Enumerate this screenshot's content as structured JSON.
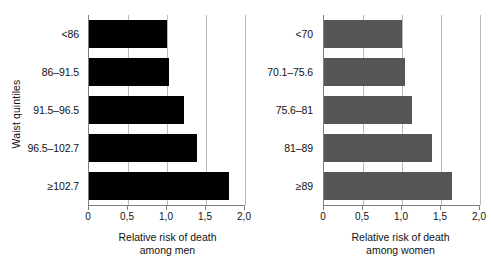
{
  "chart_data": [
    {
      "type": "bar",
      "orientation": "horizontal",
      "panel": "men",
      "title": "",
      "xlabel": "Relative risk of death among men",
      "xlabel_line1": "Relative risk of death",
      "xlabel_line2": "among men",
      "ylabel": "Waist quintiles",
      "categories": [
        "<86",
        "86–91.5",
        "91.5–96.5",
        "96.5–102.7",
        "≥102.7"
      ],
      "values": [
        1.0,
        1.03,
        1.22,
        1.39,
        1.79
      ],
      "bar_color": "#000000",
      "xlim": [
        0,
        2.0
      ],
      "xticks": [
        0,
        0.5,
        1.0,
        1.5,
        2.0
      ],
      "xticklabels": [
        "0",
        "0,5",
        "1,0",
        "1,5",
        "2,0"
      ],
      "grid": true,
      "legend": "none"
    },
    {
      "type": "bar",
      "orientation": "horizontal",
      "panel": "women",
      "title": "",
      "xlabel": "Relative risk of death among women",
      "xlabel_line1": "Relative risk of death",
      "xlabel_line2": "among women",
      "ylabel": "",
      "categories": [
        "<70",
        "70.1–75.6",
        "75.6–81",
        "81–89",
        "≥89"
      ],
      "values": [
        1.0,
        1.04,
        1.13,
        1.39,
        1.64
      ],
      "bar_color": "#565656",
      "xlim": [
        0,
        2.0
      ],
      "xticks": [
        0,
        0.5,
        1.0,
        1.5,
        2.0
      ],
      "xticklabels": [
        "0",
        "0,5",
        "1,0",
        "1,5",
        "2,0"
      ],
      "grid": true,
      "legend": "none"
    }
  ],
  "men": {
    "y_axis_title": "Waist quintiles",
    "x_axis_title_line1": "Relative risk of death",
    "x_axis_title_line2": "among men",
    "categories": [
      "<86",
      "86–91.5",
      "91.5–96.5",
      "96.5–102.7",
      "≥102.7"
    ],
    "tick_labels": [
      "0",
      "0,5",
      "1,0",
      "1,5",
      "2,0"
    ]
  },
  "women": {
    "y_axis_title": "",
    "x_axis_title_line1": "Relative risk of death",
    "x_axis_title_line2": "among women",
    "categories": [
      "<70",
      "70.1–75.6",
      "75.6–81",
      "81–89",
      "≥89"
    ],
    "tick_labels": [
      "0",
      "0,5",
      "1,0",
      "1,5",
      "2,0"
    ]
  },
  "colors": {
    "men_bar": "#000000",
    "women_bar": "#565656",
    "gridline": "#b9b9b9",
    "axis": "#7d7d7d",
    "background": "#ffffff",
    "text": "#111111"
  }
}
